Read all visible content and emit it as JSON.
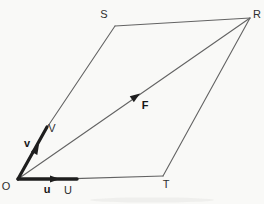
{
  "figure": {
    "type": "vector-parallelogram-diagram",
    "colors": {
      "background": "#f9f9f7",
      "thin_line": "#636363",
      "ink": "#1e1e1e",
      "smudge": "#ebebe8"
    },
    "labels": {
      "S": "S",
      "R": "R",
      "O": "O",
      "T": "T",
      "V": "V",
      "U": "U",
      "v": "v",
      "u": "u",
      "F": "F"
    },
    "vertices": [
      {
        "id": "O",
        "label": "O",
        "x": 18,
        "y": 179,
        "role": "origin"
      },
      {
        "id": "S",
        "label": "S",
        "x": 115,
        "y": 26,
        "role": "top-left corner"
      },
      {
        "id": "R",
        "label": "R",
        "x": 250,
        "y": 18,
        "role": "top-right corner"
      },
      {
        "id": "T",
        "label": "T",
        "x": 163,
        "y": 176,
        "role": "bottom-right corner"
      },
      {
        "id": "V",
        "label": "V",
        "x": 47,
        "y": 127,
        "role": "tip of vector v"
      },
      {
        "id": "U",
        "label": "U",
        "x": 68,
        "y": 179,
        "role": "tip of vector u"
      }
    ],
    "vectors": [
      {
        "id": "v",
        "label": "v",
        "from": "O",
        "to": "V",
        "style": "thick, arrowhead mid-segment"
      },
      {
        "id": "u",
        "label": "u",
        "from": "O",
        "to": "U",
        "style": "thick, arrowhead mid-segment"
      },
      {
        "id": "F",
        "label": "F",
        "from": "O",
        "to": "R",
        "style": "thin diagonal, arrowhead mid-segment"
      }
    ]
  }
}
